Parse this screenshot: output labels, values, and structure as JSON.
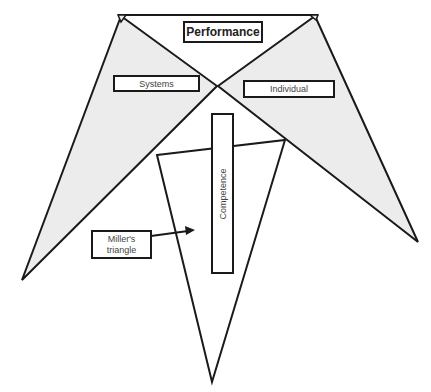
{
  "diagram": {
    "type": "conceptual-triangle-diagram",
    "labels": {
      "performance": "Performance",
      "systems": "Systems",
      "individual": "Individual",
      "competence": "Competence",
      "millers_line1": "Miller's",
      "millers_line2": "triangle"
    },
    "colors": {
      "fill": "#ececec",
      "stroke": "#1a1a1a",
      "background": "#ffffff",
      "label_text": "#444444"
    },
    "shapes": [
      {
        "name": "top-band",
        "description": "white inverted triangle under Performance"
      },
      {
        "name": "systems-triangle",
        "fill": "grey"
      },
      {
        "name": "individual-triangle",
        "fill": "grey"
      },
      {
        "name": "millers-triangle",
        "fill": "white",
        "orientation": "inverted"
      }
    ],
    "arrow": {
      "from": "millers-triangle-label",
      "to": "millers-triangle"
    }
  }
}
